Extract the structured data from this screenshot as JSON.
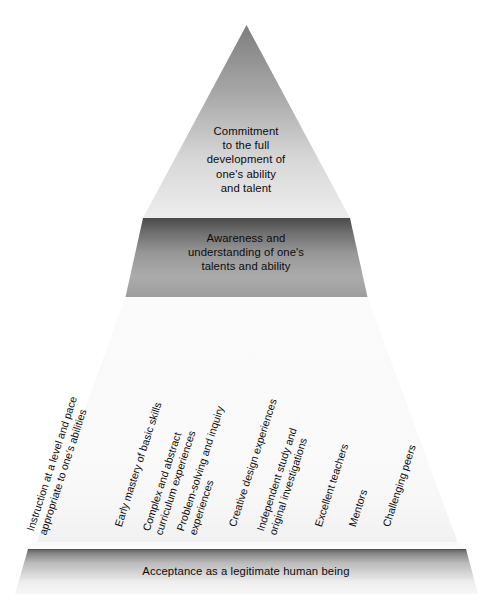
{
  "diagram": {
    "title_alt": "Pyramid of talent development",
    "type": "pyramid",
    "colors": {
      "tier1_top": "#8a8a8a",
      "tier1_bottom": "#e8e8e8",
      "tier2_top": "#4e4e4e",
      "tier2_bottom": "#b4b4b4",
      "tier3_light": "#fdfdfd",
      "tier3_shade": "#b8b8b8",
      "base_top": "#6f6f6f",
      "base_bottom": "#f2f2f2",
      "text": "#0c0c0c"
    },
    "tiers": [
      {
        "id": "tier-1",
        "name": "commitment",
        "label": "Commitment\nto the full\ndevelopment of\none's ability\nand talent"
      },
      {
        "id": "tier-2",
        "name": "awareness",
        "label": "Awareness and\nunderstanding of one's\ntalents and ability"
      }
    ],
    "base": {
      "id": "base-bar",
      "name": "acceptance",
      "label": "Acceptance as a legitimate human being"
    },
    "factors": [
      {
        "id": "factor-1",
        "label": "Instruction at a level and pace\nappropriate to one's abilities",
        "lines": 2
      },
      {
        "id": "factor-2",
        "label": "Early mastery of basic skills",
        "lines": 1
      },
      {
        "id": "factor-3",
        "label": "Complex and abstract\ncurriculum experiences",
        "lines": 2
      },
      {
        "id": "factor-4",
        "label": "Problem-solving and inquiry\nexperiences",
        "lines": 2
      },
      {
        "id": "factor-5",
        "label": "Creative design experiences",
        "lines": 1
      },
      {
        "id": "factor-6",
        "label": "Independent study and\noriginal investigations",
        "lines": 2
      },
      {
        "id": "factor-7",
        "label": "Excellent teachers",
        "lines": 1
      },
      {
        "id": "factor-8",
        "label": "Mentors",
        "lines": 1
      },
      {
        "id": "factor-9",
        "label": "Challenging peers",
        "lines": 1
      }
    ]
  }
}
